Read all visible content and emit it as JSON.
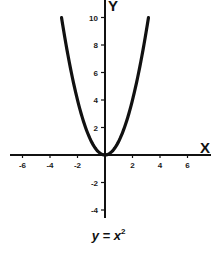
{
  "chart_data": {
    "type": "line",
    "function": "y = x^2",
    "xlabel": "X",
    "ylabel": "Y",
    "xlim": [
      -7,
      7.5
    ],
    "ylim": [
      -4.5,
      10.5
    ],
    "x_ticks": [
      -6,
      -4,
      -2,
      2,
      4,
      6
    ],
    "y_ticks": [
      10,
      8,
      6,
      4,
      2,
      -2,
      -4
    ],
    "grid": false,
    "legend": null,
    "series": [
      {
        "name": "y = x^2",
        "x": [
          -3.16,
          -3,
          -2.5,
          -2,
          -1.5,
          -1,
          -0.5,
          0,
          0.5,
          1,
          1.5,
          2,
          2.5,
          3,
          3.16
        ],
        "y": [
          10,
          9,
          6.25,
          4,
          2.25,
          1,
          0.25,
          0,
          0.25,
          1,
          2.25,
          4,
          6.25,
          9,
          10
        ]
      }
    ]
  },
  "caption": {
    "lhs": "y = x",
    "exponent": "2"
  },
  "colors": {
    "curve": "#111111",
    "axes": "#111111",
    "background": "#ffffff"
  }
}
